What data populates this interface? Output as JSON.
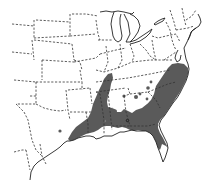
{
  "map": {
    "title": "Species range map, southeastern United States",
    "region": "Eastern United States",
    "legend": [],
    "range_color": "#5a5a5a",
    "background_color": "#ffffff",
    "boundary_color": "#333333",
    "shaded_region_description": "Range covers east Texas, Louisiana, Arkansas, Mississippi, Alabama, Georgia, South Carolina, North Carolina, southeastern Virginia and northern Florida, with scattered outlying spots",
    "features": [
      "dashed state boundaries",
      "solid coastline",
      "Great Lakes outline",
      "shaded range area",
      "scattered outlier dots"
    ]
  }
}
